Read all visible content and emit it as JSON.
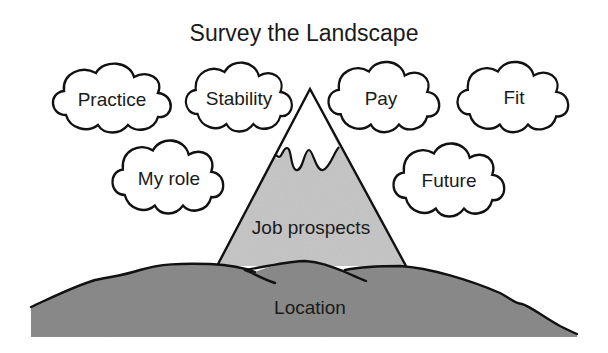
{
  "title": "Survey the Landscape",
  "clouds": [
    {
      "id": "practice",
      "label": "Practice",
      "cx": 112,
      "cy": 99
    },
    {
      "id": "stability",
      "label": "Stability",
      "cx": 239,
      "cy": 98
    },
    {
      "id": "pay",
      "label": "Pay",
      "cx": 384,
      "cy": 98
    },
    {
      "id": "fit",
      "label": "Fit",
      "cx": 513,
      "cy": 98
    },
    {
      "id": "my-role",
      "label": "My role",
      "cx": 168,
      "cy": 178
    },
    {
      "id": "future",
      "label": "Future",
      "cx": 449,
      "cy": 181
    }
  ],
  "mountain": {
    "label": "Job prospects",
    "fill": "#c8c8c8",
    "snow_fill": "#ffffff"
  },
  "ground": {
    "label": "Location",
    "fill": "#8c8c8c"
  },
  "colors": {
    "stroke": "#111111",
    "background": "#ffffff"
  }
}
